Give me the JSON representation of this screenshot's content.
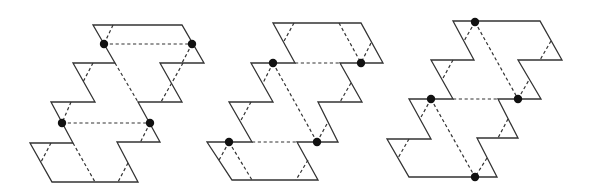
{
  "diagram": {
    "colors": {
      "stroke": "#333333",
      "dot": "#111111",
      "background": "#ffffff"
    },
    "figures": [
      {
        "id": "figure-1",
        "outline": [
          [
            93,
            25
          ],
          [
            182,
            25
          ],
          [
            204,
            63
          ],
          [
            160,
            63
          ],
          [
            182,
            102
          ],
          [
            138,
            102
          ],
          [
            160,
            142
          ],
          [
            117,
            142
          ],
          [
            138,
            182
          ],
          [
            52,
            182
          ],
          [
            30,
            143
          ],
          [
            73,
            143
          ],
          [
            51,
            102
          ],
          [
            95,
            102
          ],
          [
            73,
            63
          ],
          [
            115,
            63
          ]
        ],
        "dashed": [
          [
            [
              113,
              25
            ],
            [
              104,
              44
            ]
          ],
          [
            [
              104,
              44
            ],
            [
              192,
              44
            ]
          ],
          [
            [
              115,
              63
            ],
            [
              138,
              102
            ]
          ],
          [
            [
              192,
              44
            ],
            [
              182,
              63
            ]
          ],
          [
            [
              183,
              63
            ],
            [
              161,
              102
            ]
          ],
          [
            [
              93,
              63
            ],
            [
              83,
              82
            ]
          ],
          [
            [
              71,
              102
            ],
            [
              62,
              123
            ]
          ],
          [
            [
              62,
              123
            ],
            [
              150,
              123
            ]
          ],
          [
            [
              73,
              143
            ],
            [
              95,
              182
            ]
          ],
          [
            [
              150,
              123
            ],
            [
              140,
              143
            ]
          ],
          [
            [
              51,
              143
            ],
            [
              41,
              162
            ]
          ],
          [
            [
              128,
              163
            ],
            [
              118,
              182
            ]
          ]
        ],
        "dots": [
          [
            104,
            44
          ],
          [
            192,
            44
          ],
          [
            62,
            123
          ],
          [
            150,
            123
          ]
        ]
      },
      {
        "id": "figure-2",
        "outline": [
          [
            273,
            23
          ],
          [
            361,
            23
          ],
          [
            383,
            63
          ],
          [
            340,
            63
          ],
          [
            362,
            102
          ],
          [
            318,
            102
          ],
          [
            338,
            142
          ],
          [
            297,
            142
          ],
          [
            318,
            180
          ],
          [
            232,
            180
          ],
          [
            207,
            142
          ],
          [
            252,
            142
          ],
          [
            229,
            102
          ],
          [
            273,
            102
          ],
          [
            251,
            63
          ],
          [
            295,
            63
          ]
        ],
        "dashed": [
          [
            [
              294,
              23
            ],
            [
              283,
              43
            ]
          ],
          [
            [
              339,
              23
            ],
            [
              361,
              63
            ]
          ],
          [
            [
              371,
              43
            ],
            [
              361,
              63
            ]
          ],
          [
            [
              295,
              63
            ],
            [
              340,
              63
            ]
          ],
          [
            [
              273,
              63
            ],
            [
              263,
              83
            ]
          ],
          [
            [
              273,
              63
            ],
            [
              317,
              142
            ]
          ],
          [
            [
              351,
              83
            ],
            [
              340,
              102
            ]
          ],
          [
            [
              229,
              142
            ],
            [
              218,
              162
            ]
          ],
          [
            [
              229,
              142
            ],
            [
              252,
              180
            ]
          ],
          [
            [
              252,
              142
            ],
            [
              297,
              142
            ]
          ],
          [
            [
              317,
              142
            ],
            [
              328,
              122
            ]
          ],
          [
            [
              308,
              160
            ],
            [
              296,
              180
            ]
          ],
          [
            [
              251,
              102
            ],
            [
              240,
              122
            ]
          ]
        ],
        "dots": [
          [
            273,
            63
          ],
          [
            361,
            63
          ],
          [
            229,
            142
          ],
          [
            317,
            142
          ]
        ]
      },
      {
        "id": "figure-3",
        "outline": [
          [
            453,
            21
          ],
          [
            540,
            21
          ],
          [
            562,
            60
          ],
          [
            518,
            60
          ],
          [
            541,
            99
          ],
          [
            498,
            99
          ],
          [
            518,
            138
          ],
          [
            477,
            138
          ],
          [
            497,
            177
          ],
          [
            409,
            177
          ],
          [
            387,
            139
          ],
          [
            431,
            139
          ],
          [
            409,
            99
          ],
          [
            453,
            99
          ],
          [
            431,
            60
          ],
          [
            474,
            60
          ]
        ],
        "dashed": [
          [
            [
              475,
              22
            ],
            [
              464,
              41
            ]
          ],
          [
            [
              475,
              22
            ],
            [
              518,
              99
            ]
          ],
          [
            [
              551,
              41
            ],
            [
              540,
              60
            ]
          ],
          [
            [
              453,
              60
            ],
            [
              442,
              80
            ]
          ],
          [
            [
              453,
              99
            ],
            [
              498,
              99
            ]
          ],
          [
            [
              431,
              99
            ],
            [
              420,
              119
            ]
          ],
          [
            [
              431,
              99
            ],
            [
              475,
              177
            ]
          ],
          [
            [
              518,
              99
            ],
            [
              529,
              80
            ]
          ],
          [
            [
              508,
              119
            ],
            [
              498,
              138
            ]
          ],
          [
            [
              409,
              139
            ],
            [
              398,
              158
            ]
          ],
          [
            [
              487,
              158
            ],
            [
              475,
              177
            ]
          ]
        ],
        "dots": [
          [
            475,
            22
          ],
          [
            518,
            99
          ],
          [
            431,
            99
          ],
          [
            475,
            177
          ]
        ]
      }
    ]
  }
}
